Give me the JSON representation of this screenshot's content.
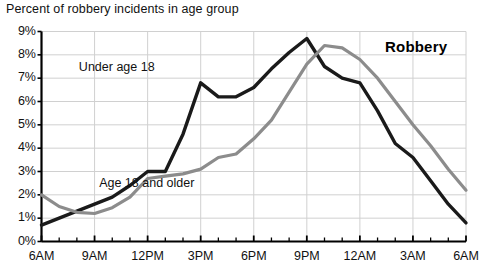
{
  "chart_data": {
    "type": "line",
    "title": "Percent of robbery incidents in age group",
    "badge": "Robbery",
    "xlabel": "",
    "ylabel": "",
    "grid": true,
    "legend_position": "inline-annotations",
    "ylim": [
      0,
      9
    ],
    "ytick_labels": [
      "0%",
      "1%",
      "2%",
      "3%",
      "4%",
      "5%",
      "6%",
      "7%",
      "8%",
      "9%"
    ],
    "ytick_values": [
      0,
      1,
      2,
      3,
      4,
      5,
      6,
      7,
      8,
      9
    ],
    "xtick_labels": [
      "6AM",
      "9AM",
      "12PM",
      "3PM",
      "6PM",
      "9PM",
      "12AM",
      "3AM",
      "6AM"
    ],
    "xtick_hours": [
      0,
      3,
      6,
      9,
      12,
      15,
      18,
      21,
      24
    ],
    "x": [
      0,
      1,
      2,
      3,
      4,
      5,
      6,
      7,
      8,
      9,
      10,
      11,
      12,
      13,
      14,
      15,
      16,
      17,
      18,
      19,
      20,
      21,
      22,
      23,
      24
    ],
    "x_clock": [
      "6AM",
      "7AM",
      "8AM",
      "9AM",
      "10AM",
      "11AM",
      "12PM",
      "1PM",
      "2PM",
      "3PM",
      "4PM",
      "5PM",
      "6PM",
      "7PM",
      "8PM",
      "9PM",
      "10PM",
      "11PM",
      "12AM",
      "1AM",
      "2AM",
      "3AM",
      "4AM",
      "5AM",
      "6AM"
    ],
    "series": [
      {
        "name": "Under age 18",
        "color": "#1a1a1a",
        "label_x_hour": 4.6,
        "label_y_value": 7.45,
        "values": [
          0.7,
          1.0,
          1.3,
          1.6,
          1.9,
          2.4,
          3.0,
          3.0,
          4.6,
          6.8,
          6.2,
          6.2,
          6.6,
          7.4,
          8.1,
          8.7,
          7.5,
          7.0,
          6.8,
          5.6,
          4.2,
          3.6,
          2.6,
          1.6,
          0.8
        ]
      },
      {
        "name": "Age 18 and older",
        "color": "#8c8c8c",
        "label_x_hour": 6.2,
        "label_y_value": 2.45,
        "values": [
          2.0,
          1.5,
          1.25,
          1.2,
          1.45,
          1.9,
          2.7,
          2.8,
          2.9,
          3.1,
          3.6,
          3.75,
          4.4,
          5.2,
          6.4,
          7.6,
          8.4,
          8.3,
          7.8,
          7.0,
          6.0,
          5.0,
          4.1,
          3.1,
          2.2
        ]
      }
    ]
  }
}
